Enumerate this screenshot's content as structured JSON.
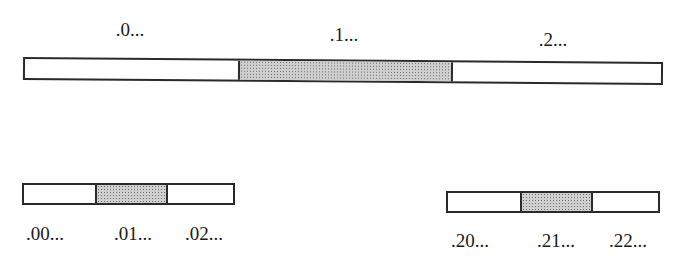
{
  "diagram": {
    "top": {
      "segments": [
        {
          "label": ".0...",
          "shaded": false
        },
        {
          "label": ".1...",
          "shaded": true
        },
        {
          "label": ".2...",
          "shaded": false
        }
      ]
    },
    "bottom_left": {
      "segments": [
        {
          "label": ".00...",
          "shaded": false
        },
        {
          "label": ".01...",
          "shaded": true
        },
        {
          "label": ".02...",
          "shaded": false
        }
      ]
    },
    "bottom_right": {
      "segments": [
        {
          "label": ".20...",
          "shaded": false
        },
        {
          "label": ".21...",
          "shaded": true
        },
        {
          "label": ".22...",
          "shaded": false
        }
      ]
    },
    "colors": {
      "outline": "#2a2a2a",
      "shaded_fill": "#cfcfcf",
      "background": "#ffffff"
    }
  }
}
